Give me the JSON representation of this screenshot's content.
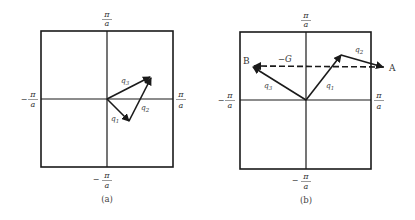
{
  "panels": [
    {
      "id": "a",
      "caption": "(a)",
      "axis_labels": {
        "top": {
          "num": "π",
          "den": "a",
          "sign": ""
        },
        "bottom": {
          "num": "π",
          "den": "a",
          "sign": "−"
        },
        "left": {
          "num": "π",
          "den": "a",
          "sign": "−"
        },
        "right": {
          "num": "π",
          "den": "a",
          "sign": ""
        }
      },
      "vectors": {
        "q1": {
          "label": "q",
          "sub": "1"
        },
        "q2": {
          "label": "q",
          "sub": "2"
        },
        "q3": {
          "label": "q",
          "sub": "3"
        }
      }
    },
    {
      "id": "b",
      "caption": "(b)",
      "axis_labels": {
        "top": {
          "num": "π",
          "den": "a",
          "sign": ""
        },
        "bottom": {
          "num": "π",
          "den": "a",
          "sign": "−"
        },
        "left": {
          "num": "π",
          "den": "a",
          "sign": "−"
        },
        "right": {
          "num": "π",
          "den": "a",
          "sign": ""
        }
      },
      "vectors": {
        "q1": {
          "label": "q",
          "sub": "1"
        },
        "q2": {
          "label": "q",
          "sub": "2"
        },
        "q3": {
          "label": "q",
          "sub": "3"
        }
      },
      "points": {
        "A": "A",
        "B": "B"
      },
      "reciprocal_vector": "−G"
    }
  ],
  "colors": {
    "line": "#1a1a1a",
    "text": "#333333"
  }
}
